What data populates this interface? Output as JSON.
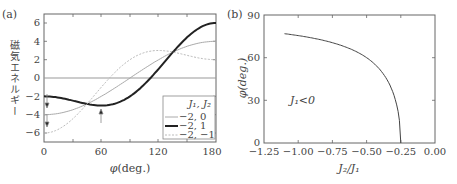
{
  "chart_data": [
    {
      "panel_label": "(a)",
      "type": "line",
      "title": "",
      "xlabel": "φ(deg.)",
      "ylabel": "磁気エネルギー",
      "xlim": [
        0,
        180
      ],
      "ylim": [
        -7,
        7
      ],
      "xticks": [
        "0",
        "60",
        "120",
        "180"
      ],
      "yticks": [
        "6",
        "4",
        "2",
        "0",
        "−2",
        "−4",
        "−6"
      ],
      "grid": false,
      "legend_title": "J1, J2",
      "legend_position": "lower right",
      "series": [
        {
          "name": "−2, 0",
          "style": "thin solid gray",
          "x": [
            0,
            30,
            60,
            90,
            120,
            150,
            180
          ],
          "values": [
            -4,
            -3.46,
            -2,
            0,
            2,
            3.46,
            4
          ]
        },
        {
          "name": "−2, 1",
          "style": "thick solid black",
          "x": [
            0,
            30,
            60,
            90,
            120,
            150,
            180
          ],
          "values": [
            -2,
            -2.46,
            -3,
            -2,
            1,
            4.46,
            6
          ]
        },
        {
          "name": "−2, −1",
          "style": "dotted gray",
          "x": [
            0,
            30,
            60,
            90,
            120,
            150,
            180
          ],
          "values": [
            -6,
            -4.46,
            -1,
            2,
            3,
            2.46,
            2
          ]
        }
      ],
      "annotations": [
        "arrow at φ=0 on −2,0 curve min",
        "arrow at φ=0 on −2,−1 curve min",
        "arrow at φ=60 on −2,1 curve min"
      ]
    },
    {
      "panel_label": "(b)",
      "type": "line",
      "title": "",
      "xlabel": "J2/J1",
      "ylabel": "φ(deg.)",
      "xlim": [
        -1.25,
        0.0
      ],
      "ylim": [
        0,
        90
      ],
      "xticks": [
        "−1.25",
        "−1.00",
        "−0.75",
        "−0.50",
        "−0.25",
        "0.00"
      ],
      "yticks": [
        "0",
        "30",
        "60",
        "90"
      ],
      "grid": false,
      "annotation_text": "J1<0",
      "series": [
        {
          "name": "φ",
          "x": [
            -1.1,
            -1.0,
            -0.75,
            -0.5,
            -0.4,
            -0.3,
            -0.25
          ],
          "values": [
            76.9,
            75.5,
            70.5,
            60,
            51.3,
            33.6,
            0
          ]
        }
      ]
    }
  ],
  "panel_a": {
    "label": "(a)",
    "ylabel": "磁気エネルギー",
    "xlabel_phi": "φ",
    "xlabel_unit": "(deg.)",
    "xticks": [
      "0",
      "60",
      "120",
      "180"
    ],
    "yticks": [
      "6",
      "4",
      "2",
      "0",
      "−2",
      "−4",
      "−6"
    ],
    "legend": {
      "title": "J₁, J₂",
      "items": [
        "−2, 0",
        "−2, 1",
        "−2, −1"
      ]
    }
  },
  "panel_b": {
    "label": "(b)",
    "ylabel": "φ(deg.)",
    "xlabel": "J₂/J₁",
    "xticks": [
      "−1.25",
      "−1.00",
      "−0.75",
      "−0.50",
      "−0.25",
      "0.00"
    ],
    "yticks": [
      "90",
      "60",
      "30",
      "0"
    ],
    "annotation": "J₁<0"
  },
  "colors": {
    "axis": "#555555",
    "thin_curve": "#aaaaaa",
    "thick_curve": "#222222",
    "dotted_curve": "#bbbbbb"
  }
}
